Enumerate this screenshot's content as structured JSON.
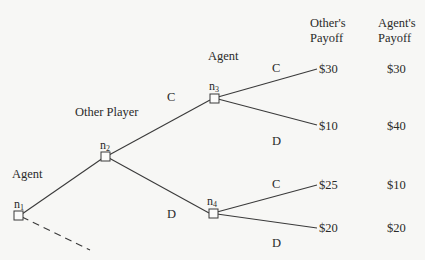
{
  "headers": {
    "others_payoff_line1": "Other's",
    "others_payoff_line2": "Payoff",
    "agents_payoff_line1": "Agent's",
    "agents_payoff_line2": "Payoff"
  },
  "players": {
    "n1_player": "Agent",
    "n2_player": "Other Player",
    "n3_player": "Agent"
  },
  "nodes": {
    "n1": {
      "base": "n",
      "sub": "1"
    },
    "n2": {
      "base": "n",
      "sub": "2"
    },
    "n3": {
      "base": "n",
      "sub": "3"
    },
    "n4": {
      "base": "n",
      "sub": "4"
    }
  },
  "branches": {
    "n2_up": "C",
    "n2_down": "D",
    "n3_up": "C",
    "n3_down": "D",
    "n4_up": "C",
    "n4_down": "D"
  },
  "outcomes": [
    {
      "path": "C,C",
      "others": "$30",
      "agents": "$30"
    },
    {
      "path": "C,D",
      "others": "$10",
      "agents": "$40"
    },
    {
      "path": "D,C",
      "others": "$25",
      "agents": "$10"
    },
    {
      "path": "D,D",
      "others": "$20",
      "agents": "$20"
    }
  ],
  "colors": {
    "line": "#3a3a3a",
    "text": "#2a2a2a",
    "background": "#f7f7f5"
  }
}
